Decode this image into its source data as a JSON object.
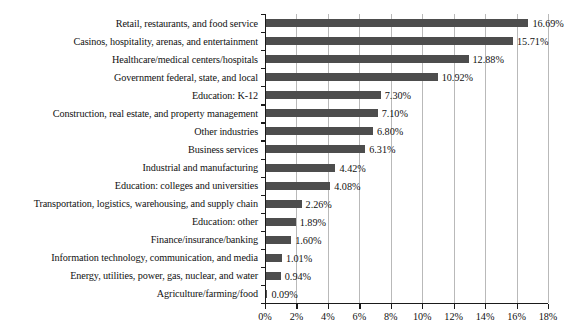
{
  "chart_data": {
    "type": "bar",
    "orientation": "horizontal",
    "title": "",
    "subtitle": "",
    "xlabel": "",
    "ylabel": "",
    "xlim": [
      0,
      18
    ],
    "grid": true,
    "legend": false,
    "value_suffix": "%",
    "xticks": [
      "0%",
      "2%",
      "4%",
      "6%",
      "8%",
      "10%",
      "12%",
      "14%",
      "16%",
      "18%"
    ],
    "xtick_values": [
      0,
      2,
      4,
      6,
      8,
      10,
      12,
      14,
      16,
      18
    ],
    "bar_color": "#4d4d4d",
    "gridline_color": "#b9b9b9",
    "axis_color": "#1a1a1a",
    "categories": [
      "Retail, restaurants, and food service",
      "Casinos, hospitality, arenas, and entertainment",
      "Healthcare/medical centers/hospitals",
      "Government federal, state, and local",
      "Education: K-12",
      "Construction, real estate, and property management",
      "Other industries",
      "Business services",
      "Industrial and manufacturing",
      "Education: colleges and universities",
      "Transportation, logistics, warehousing, and supply chain",
      "Education: other",
      "Finance/insurance/banking",
      "Information technology, communication, and media",
      "Energy, utilities, power, gas, nuclear, and water",
      "Agriculture/farming/food"
    ],
    "values": [
      16.69,
      15.71,
      12.88,
      10.92,
      7.3,
      7.1,
      6.8,
      6.31,
      4.42,
      4.08,
      2.26,
      1.89,
      1.6,
      1.01,
      0.94,
      0.09
    ],
    "value_labels": [
      "16.69%",
      "15.71%",
      "12.88%",
      "10.92%",
      "7.30%",
      "7.10%",
      "6.80%",
      "6.31%",
      "4.42%",
      "4.08%",
      "2.26%",
      "1.89%",
      "1.60%",
      "1.01%",
      "0.94%",
      "0.09%"
    ]
  }
}
